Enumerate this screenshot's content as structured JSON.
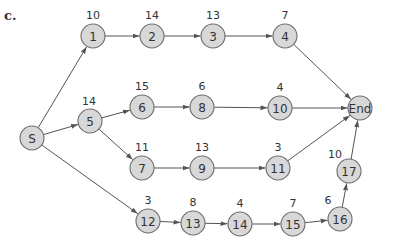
{
  "part_label": "c.",
  "node_style": {
    "fill": "#d8d8d8",
    "stroke": "#6e6e6e",
    "radius": 12
  },
  "nodes": [
    {
      "id": "S",
      "label": "S",
      "x": 32,
      "y": 138,
      "duration": null
    },
    {
      "id": "1",
      "label": "1",
      "x": 93,
      "y": 36,
      "duration": "10"
    },
    {
      "id": "2",
      "label": "2",
      "x": 152,
      "y": 36,
      "duration": "14"
    },
    {
      "id": "3",
      "label": "3",
      "x": 213,
      "y": 36,
      "duration": "13"
    },
    {
      "id": "4",
      "label": "4",
      "x": 285,
      "y": 36,
      "duration": "7"
    },
    {
      "id": "5",
      "label": "5",
      "x": 90,
      "y": 121,
      "duration": "14"
    },
    {
      "id": "6",
      "label": "6",
      "x": 142,
      "y": 107,
      "duration": "15"
    },
    {
      "id": "8",
      "label": "8",
      "x": 202,
      "y": 107,
      "duration": "6"
    },
    {
      "id": "10",
      "label": "10",
      "x": 280,
      "y": 108,
      "duration": "4"
    },
    {
      "id": "7",
      "label": "7",
      "x": 142,
      "y": 168,
      "duration": "11"
    },
    {
      "id": "9",
      "label": "9",
      "x": 202,
      "y": 168,
      "duration": "13"
    },
    {
      "id": "11",
      "label": "11",
      "x": 278,
      "y": 168,
      "duration": "3"
    },
    {
      "id": "12",
      "label": "12",
      "x": 148,
      "y": 221,
      "duration": "3"
    },
    {
      "id": "13",
      "label": "13",
      "x": 193,
      "y": 223,
      "duration": "8"
    },
    {
      "id": "14",
      "label": "14",
      "x": 240,
      "y": 224,
      "duration": "4"
    },
    {
      "id": "15",
      "label": "15",
      "x": 293,
      "y": 224,
      "duration": "7"
    },
    {
      "id": "16",
      "label": "16",
      "x": 340,
      "y": 219,
      "duration": "6"
    },
    {
      "id": "17",
      "label": "17",
      "x": 349,
      "y": 171,
      "duration": "10"
    },
    {
      "id": "End",
      "label": "End",
      "x": 360,
      "y": 108,
      "duration": null
    }
  ],
  "edges": [
    [
      "S",
      "1"
    ],
    [
      "S",
      "5"
    ],
    [
      "S",
      "12"
    ],
    [
      "1",
      "2"
    ],
    [
      "2",
      "3"
    ],
    [
      "3",
      "4"
    ],
    [
      "4",
      "End"
    ],
    [
      "5",
      "6"
    ],
    [
      "5",
      "7"
    ],
    [
      "6",
      "8"
    ],
    [
      "8",
      "10"
    ],
    [
      "10",
      "End"
    ],
    [
      "7",
      "9"
    ],
    [
      "9",
      "11"
    ],
    [
      "11",
      "End"
    ],
    [
      "12",
      "13"
    ],
    [
      "13",
      "14"
    ],
    [
      "14",
      "15"
    ],
    [
      "15",
      "16"
    ],
    [
      "16",
      "17"
    ],
    [
      "17",
      "End"
    ]
  ],
  "duration_offsets": {
    "17": {
      "dx": -14,
      "dy": -13
    },
    "16": {
      "dx": -12,
      "dy": -15
    },
    "5": {
      "dx": -1,
      "dy": -16
    },
    "default": {
      "dx": 0,
      "dy": -17
    }
  }
}
